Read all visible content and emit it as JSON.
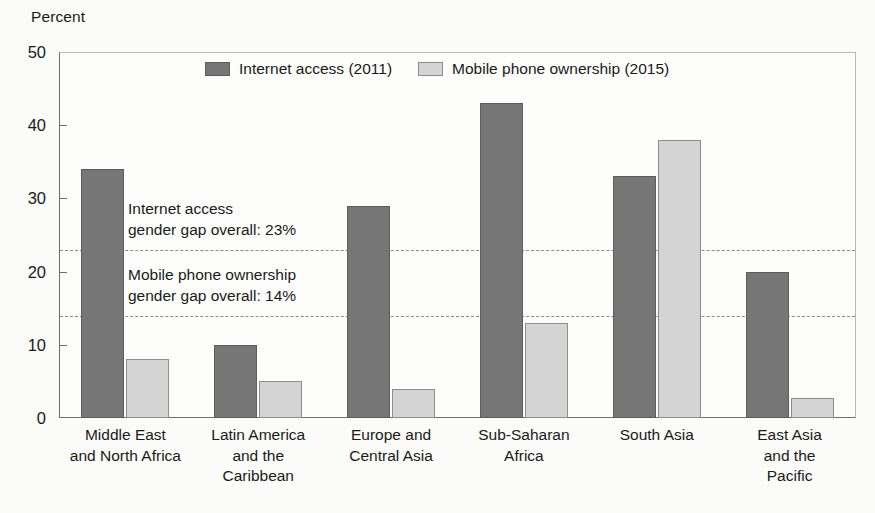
{
  "chart_data": {
    "type": "bar",
    "title": "",
    "ylabel": "Percent",
    "xlabel": "",
    "ylim": [
      0,
      50
    ],
    "yticks": [
      0,
      10,
      20,
      30,
      40,
      50
    ],
    "grid": false,
    "legend_position": "top-center",
    "categories": [
      "Middle East and North Africa",
      "Latin America and the Caribbean",
      "Europe and Central Asia",
      "Sub-Saharan Africa",
      "South Asia",
      "East Asia and the Pacific"
    ],
    "category_label_lines": [
      [
        "Middle East",
        "and North Africa"
      ],
      [
        "Latin America",
        "and the",
        "Caribbean"
      ],
      [
        "Europe and",
        "Central Asia"
      ],
      [
        "Sub-Saharan",
        "Africa"
      ],
      [
        "South Asia"
      ],
      [
        "East Asia",
        "and the",
        "Pacific"
      ]
    ],
    "series": [
      {
        "name": "Internet access (2011)",
        "color": "#767676",
        "values": [
          34,
          10,
          29,
          43,
          33,
          20
        ]
      },
      {
        "name": "Mobile phone ownership (2015)",
        "color": "#d4d4d4",
        "values": [
          8,
          5,
          4,
          13,
          38,
          2.7
        ]
      }
    ],
    "reference_lines": [
      {
        "value": 23,
        "label_lines": [
          "Internet access",
          "gender gap overall: 23%"
        ],
        "style": "dashed",
        "color": "#8a8a8a"
      },
      {
        "value": 14,
        "label_lines": [
          "Mobile phone ownership",
          "gender gap overall: 14%"
        ],
        "style": "dashed",
        "color": "#8a8a8a"
      }
    ]
  },
  "legend": {
    "items": [
      {
        "label": "Internet access (2011)",
        "swatch": "dark"
      },
      {
        "label": "Mobile phone ownership (2015)",
        "swatch": "light"
      }
    ]
  },
  "annotations": [
    {
      "line1": "Internet access",
      "line2": "gender gap overall: 23%"
    },
    {
      "line1": "Mobile phone ownership",
      "line2": "gender gap overall: 14%"
    }
  ],
  "colors": {
    "series_dark": "#767676",
    "series_light": "#d4d4d4",
    "axis": "#6f6f6f",
    "refline": "#8a8a8a",
    "text": "#1a1a1a",
    "background": "#fbfbf9"
  }
}
